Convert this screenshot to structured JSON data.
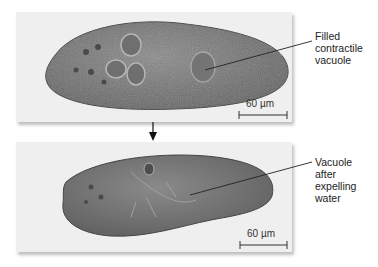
{
  "figure": {
    "panels": [
      {
        "id": "filled",
        "label_lines": [
          "Filled",
          "contractile",
          "vacuole"
        ],
        "scale_bar": "60 µm"
      },
      {
        "id": "expelled",
        "label_lines": [
          "Vacuole",
          "after",
          "expelling",
          "water"
        ],
        "scale_bar": "60 µm"
      }
    ],
    "arrow": "down-arrow"
  }
}
